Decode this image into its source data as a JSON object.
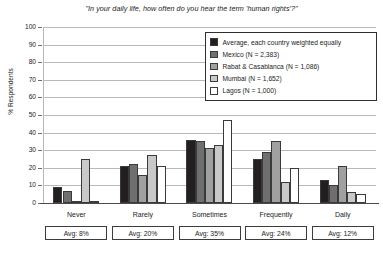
{
  "chart_data": {
    "type": "bar",
    "title": "\"In your daily life, how often do you hear the term 'human rights'?\"",
    "xlabel": "",
    "ylabel": "% Respondents",
    "ylim": [
      0,
      100
    ],
    "ytick_step": 10,
    "grid": true,
    "legend_position": "top-right",
    "categories": [
      "Never",
      "Rarely",
      "Sometimes",
      "Frequently",
      "Daily"
    ],
    "series": [
      {
        "name": "Average, each country weighted equally",
        "color": "#231f20",
        "values": [
          9,
          21,
          36,
          25,
          13
        ]
      },
      {
        "name": "Mexico (N = 2,383)",
        "color": "#6f6f6f",
        "values": [
          7,
          22,
          35,
          29,
          10
        ]
      },
      {
        "name": "Rabat & Casablanca (N = 1,086)",
        "color": "#a0a0a0",
        "values": [
          1,
          16,
          31,
          35,
          21
        ]
      },
      {
        "name": "Mumbai (N = 1,652)",
        "color": "#c9c9c9",
        "values": [
          25,
          27,
          33,
          12,
          6
        ]
      },
      {
        "name": "Lagos (N = 1,000)",
        "color": "#ffffff",
        "values": [
          1,
          21,
          47,
          20,
          5
        ]
      }
    ],
    "yticks": [
      "0",
      "10",
      "20",
      "30",
      "40",
      "50",
      "60",
      "70",
      "80",
      "90",
      "100"
    ],
    "averages": [
      "Avg: 8%",
      "Avg: 20%",
      "Avg: 35%",
      "Avg: 24%",
      "Avg: 12%"
    ]
  }
}
